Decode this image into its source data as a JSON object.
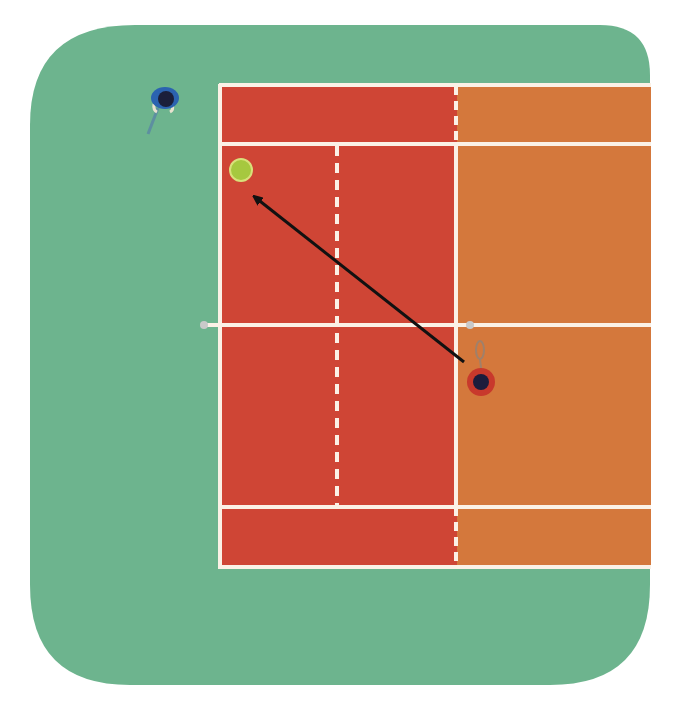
{
  "diagram": {
    "colors": {
      "background": "#ffffff",
      "surround": "#6db48e",
      "court_left_half": "#cf4535",
      "court_right_half": "#d4783c",
      "lines": "#fbf1e6",
      "arrow": "#111111",
      "ball": "#a6c83f",
      "ball_outline": "#d8e07a",
      "player_top_left_body": "#2b63b0",
      "player_top_left_head": "#1b1f3a",
      "player_right_body": "#c8392c",
      "player_right_head": "#1c1c3c",
      "net_post": "#c9c9c9"
    },
    "elements": {
      "court": {
        "label": "court",
        "left_half": "red clay side",
        "right_half": "orange side"
      },
      "net": {
        "label": "net"
      },
      "ball": {
        "label": "tennis-ball"
      },
      "shot_arrow": {
        "label": "shot direction",
        "from": "player-near-net",
        "to": "ball"
      },
      "players": [
        {
          "id": "player-outside-top-left",
          "label": "player outside court, top left",
          "team": "blue"
        },
        {
          "id": "player-near-net",
          "label": "player near net, right half",
          "team": "red"
        }
      ]
    }
  }
}
